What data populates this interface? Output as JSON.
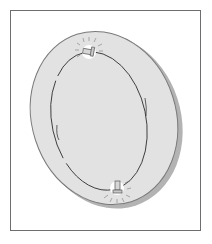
{
  "illustration": {
    "subject": "Tilted disc with inner oval line and two glowing pins",
    "caption": "",
    "colors": {
      "background": "#ffffff",
      "frame": "#6e6e6e",
      "disc_fill": "#e2e2e2",
      "disc_edge": "#7a7a7a",
      "disc_shadow": "#a8a8a8",
      "inner_line": "#3a3a3a",
      "glow": "#ffffff",
      "pin": "#d6d6d6",
      "ray": "#8a8a8a"
    },
    "elements": [
      {
        "name": "disc",
        "shape": "ellipse"
      },
      {
        "name": "inner-oval",
        "shape": "ellipse"
      },
      {
        "name": "top-pin",
        "shape": "glowing-pin"
      },
      {
        "name": "bottom-pin",
        "shape": "glowing-pin"
      }
    ]
  }
}
